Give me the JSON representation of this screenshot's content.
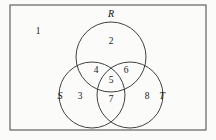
{
  "figure": {
    "kind": "venn-diagram",
    "set_count": 3,
    "background_color": "#fbfbfa",
    "stroke_color": "#2b2b2b",
    "rect_stroke_color": "#555555",
    "text_color": "#1a1a1a"
  },
  "universe": {
    "name": "universal-set-rectangle",
    "x": 10,
    "y": 5,
    "width": 196,
    "height": 125
  },
  "sets": [
    {
      "key": "R",
      "label": "R",
      "cx": 111,
      "cy": 57,
      "r": 35,
      "label_x": 111,
      "label_y": 15
    },
    {
      "key": "S",
      "label": "S",
      "cx": 92,
      "cy": 95,
      "r": 33,
      "label_x": 60,
      "label_y": 97
    },
    {
      "key": "T",
      "label": "T",
      "cx": 130,
      "cy": 95,
      "r": 33,
      "label_x": 162,
      "label_y": 97
    }
  ],
  "regions": [
    {
      "id": "outside",
      "label": "1",
      "x": 38,
      "y": 32,
      "description": "outside all sets"
    },
    {
      "id": "R-only",
      "label": "2",
      "x": 111,
      "y": 42,
      "description": "R only"
    },
    {
      "id": "S-only",
      "label": "3",
      "x": 80,
      "y": 97,
      "description": "S only"
    },
    {
      "id": "R-and-S",
      "label": "4",
      "x": 96,
      "y": 71,
      "description": "R intersect S only"
    },
    {
      "id": "R-S-and-T",
      "label": "5",
      "x": 111,
      "y": 81,
      "description": "R intersect S intersect T"
    },
    {
      "id": "R-and-T",
      "label": "6",
      "x": 126,
      "y": 71,
      "description": "R intersect T only"
    },
    {
      "id": "S-and-T",
      "label": "7",
      "x": 111,
      "y": 100,
      "description": "S intersect T only"
    },
    {
      "id": "T-only",
      "label": "8",
      "x": 147,
      "y": 97,
      "description": "T only"
    }
  ]
}
